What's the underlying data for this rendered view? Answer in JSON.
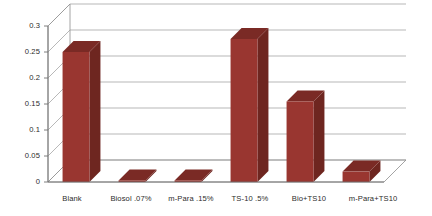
{
  "chart_data": {
    "type": "bar",
    "title": "",
    "subtitle": "",
    "xlabel": "",
    "ylabel": "",
    "categories": [
      "Blank",
      "Biosol .07%",
      "m-Para .15%",
      "TS-10 .5%",
      "Bio+TS10",
      "m-Para+TS10"
    ],
    "values": [
      0.25,
      0.003,
      0.003,
      0.275,
      0.155,
      0.02
    ],
    "series": [
      {
        "name": "Series 1",
        "values": [
          0.25,
          0.003,
          0.003,
          0.275,
          0.155,
          0.02
        ]
      }
    ],
    "ylim": [
      0,
      0.3
    ],
    "ytick_labels": [
      "0",
      "0.05",
      "0.1",
      "0.15",
      "0.2",
      "0.25",
      "0.3"
    ],
    "ytick_values": [
      0,
      0.05,
      0.1,
      0.15,
      0.2,
      0.25,
      0.3
    ],
    "grid": true,
    "legend": false,
    "legend_position": "none",
    "three_d": true,
    "bar_color": "#993630",
    "bar_top_color": "#7a2a25",
    "bar_side_color": "#6e2620",
    "gridline_color": "#9a9a9a",
    "plot_background": "#ffffff",
    "axis_color": "#6f6f6f",
    "text_color": "#2b2b2b"
  },
  "axis": {
    "y_ticks": [
      {
        "label": "0.3",
        "value": 0.3
      },
      {
        "label": "0.25",
        "value": 0.25
      },
      {
        "label": "0.2",
        "value": 0.2
      },
      {
        "label": "0.15",
        "value": 0.15
      },
      {
        "label": "0.1",
        "value": 0.1
      },
      {
        "label": "0.05",
        "value": 0.05
      },
      {
        "label": "0",
        "value": 0
      }
    ],
    "x_categories": [
      {
        "label": "Blank"
      },
      {
        "label": "Biosol .07%"
      },
      {
        "label": "m-Para .15%"
      },
      {
        "label": "TS-10 .5%"
      },
      {
        "label": "Bio+TS10"
      },
      {
        "label": "m-Para+TS10"
      }
    ]
  }
}
